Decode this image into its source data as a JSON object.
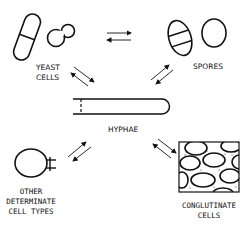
{
  "diagram": {
    "nodes": {
      "yeast": {
        "label_line1": "YEAST",
        "label_line2": "CELLS"
      },
      "spores": {
        "label": "SPORES"
      },
      "hyphae": {
        "label": "HYPHAE"
      },
      "other": {
        "label_line1": "OTHER",
        "label_line2": "DETERMINATE",
        "label_line3": "CELL TYPES"
      },
      "conglutinate": {
        "label_line1": "CONGLUTINATE",
        "label_line2": "CELLS"
      }
    },
    "edges": [
      {
        "from": "yeast",
        "to": "spores",
        "type": "bidirectional"
      },
      {
        "from": "yeast",
        "to": "hyphae",
        "type": "bidirectional"
      },
      {
        "from": "spores",
        "to": "hyphae",
        "type": "bidirectional"
      },
      {
        "from": "other",
        "to": "hyphae",
        "type": "bidirectional"
      },
      {
        "from": "conglutinate",
        "to": "hyphae",
        "type": "bidirectional"
      }
    ],
    "colors": {
      "ink": "#111111",
      "background": "#ffffff"
    }
  }
}
